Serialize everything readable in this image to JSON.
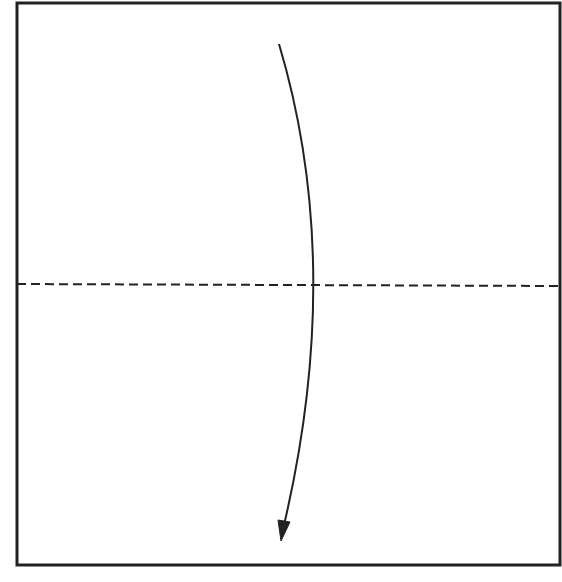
{
  "diagram": {
    "type": "origami-fold-step",
    "colors": {
      "background": "#ffffff",
      "stroke": "#222222"
    },
    "paper": {
      "x": 17,
      "y": 3,
      "width": 543,
      "height": 562
    },
    "fold_line": {
      "style": "dashed",
      "orientation": "horizontal",
      "y": 284,
      "x1": 17,
      "x2": 560
    },
    "arrow": {
      "direction": "down",
      "start": [
        279,
        44
      ],
      "control": [
        340,
        260
      ],
      "end": [
        282,
        541
      ]
    }
  }
}
